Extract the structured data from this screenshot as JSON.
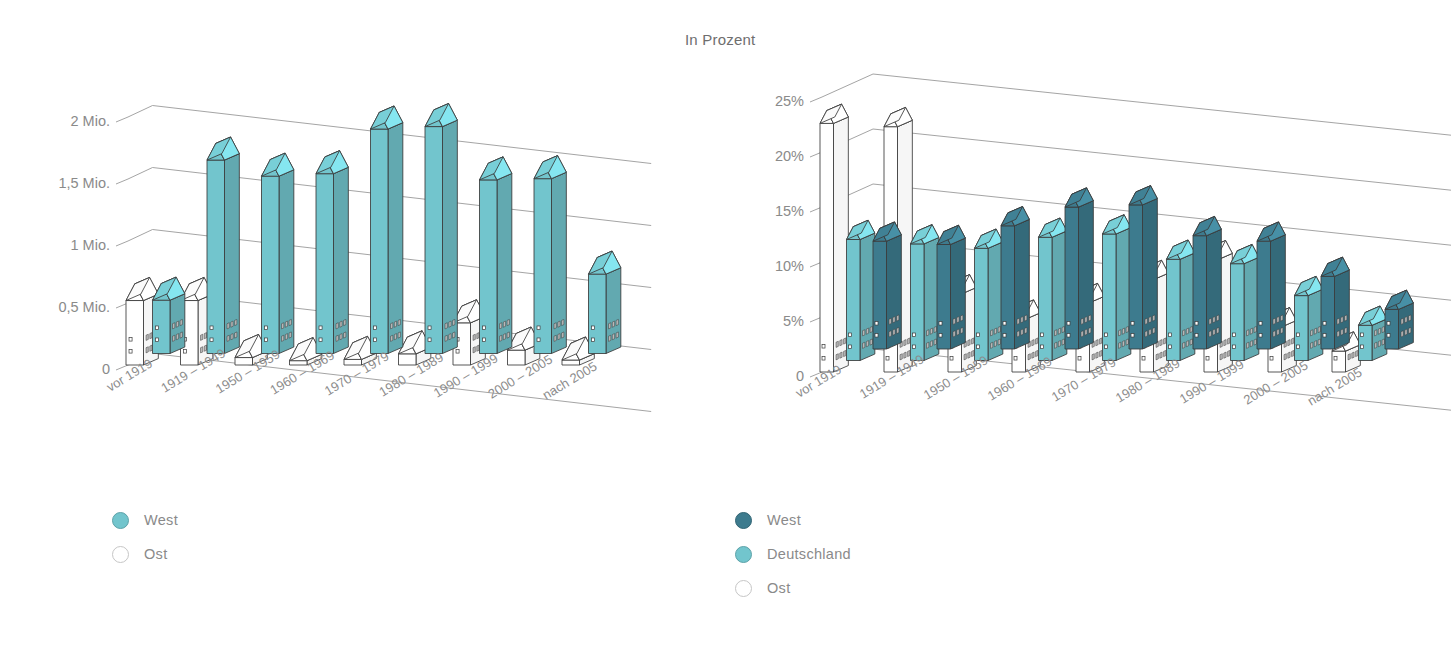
{
  "chart_data": [
    {
      "id": "left",
      "type": "bar",
      "title": "",
      "xlabel": "",
      "ylabel": "",
      "ylim": [
        0,
        2000000
      ],
      "ytick_labels": [
        "0",
        "0,5 Mio.",
        "1 Mio.",
        "1,5 Mio.",
        "2 Mio."
      ],
      "ytick_values": [
        0,
        500000,
        1000000,
        1500000,
        2000000
      ],
      "grid": true,
      "legend_position": "bottom-left",
      "categories": [
        "vor 1919",
        "1919 – 1949",
        "1950 – 1959",
        "1960 – 1969",
        "1970 – 1979",
        "1980 – 1989",
        "1990 – 1999",
        "2000 – 2005",
        "nach 2005"
      ],
      "series": [
        {
          "name": "West",
          "color": "#72c5cd",
          "values": [
            430000,
            1560000,
            1430000,
            1450000,
            1810000,
            1830000,
            1400000,
            1410000,
            640000,
            350000
          ]
        },
        {
          "name": "Ost",
          "color": "#ffffff",
          "values": [
            520000,
            520000,
            60000,
            35000,
            45000,
            90000,
            340000,
            120000,
            40000
          ]
        }
      ]
    },
    {
      "id": "right",
      "type": "bar",
      "title": "In Prozent",
      "xlabel": "",
      "ylabel": "",
      "ylim": [
        0,
        25
      ],
      "ytick_labels": [
        "0",
        "5%",
        "10%",
        "15%",
        "20%",
        "25%"
      ],
      "ytick_values": [
        0,
        5,
        10,
        15,
        20,
        25
      ],
      "grid": true,
      "legend_position": "bottom-left",
      "categories": [
        "vor 1919",
        "1919 – 1949",
        "1950 – 1959",
        "1960 – 1969",
        "1970 – 1979",
        "1980 – 1989",
        "1990 – 1999",
        "2000 – 2005",
        "nach 2005"
      ],
      "series": [
        {
          "name": "West",
          "color": "#3d7b8e",
          "values": [
            9.8,
            9.5,
            11.2,
            12.9,
            13.1,
            10.3,
            9.8,
            6.6,
            3.6
          ]
        },
        {
          "name": "Deutschland",
          "color": "#72c5cd",
          "values": [
            11.0,
            10.6,
            10.2,
            11.2,
            11.5,
            9.2,
            8.8,
            5.9,
            3.2
          ]
        },
        {
          "name": "Ost",
          "color": "#ffffff",
          "values": [
            22.6,
            22.3,
            7.1,
            4.8,
            6.3,
            8.4,
            10.2,
            4.1,
            1.9
          ]
        }
      ]
    }
  ],
  "left_chart": {
    "axis_labels": [
      "2 Mio.",
      "1,5 Mio.",
      "1 Mio.",
      "0,5 Mio.",
      "0"
    ],
    "legend": {
      "items": [
        {
          "label": "West",
          "color": "#72c5cd",
          "filled": true
        },
        {
          "label": "Ost",
          "color": "#ffffff",
          "filled": false
        }
      ]
    }
  },
  "right_chart": {
    "title": "In Prozent",
    "axis_labels": [
      "25%",
      "20%",
      "15%",
      "10%",
      "5%",
      "0"
    ],
    "legend": {
      "items": [
        {
          "label": "West",
          "color": "#3d7b8e",
          "filled": true
        },
        {
          "label": "Deutschland",
          "color": "#72c5cd",
          "filled": true
        },
        {
          "label": "Ost",
          "color": "#ffffff",
          "filled": false
        }
      ]
    }
  },
  "colors": {
    "teal": "#72c5cd",
    "teal_side": "#5fb4bd",
    "teal_roof": "#9fd9de",
    "dark_blue": "#3d7b8e",
    "dark_blue_side": "#346b7c",
    "dark_blue_roof": "#5b97a9",
    "white": "#ffffff",
    "white_side": "#f4f4f4",
    "white_roof": "#ffffff",
    "outline": "#3a3a3a",
    "grid": "#9a9a9a",
    "text": "#8a8a8a"
  }
}
